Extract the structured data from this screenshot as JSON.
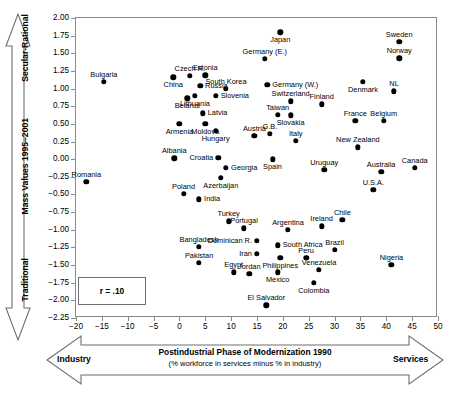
{
  "figure": {
    "annotation_r": "r = .10"
  },
  "axes": {
    "y_meta_top": "Secular-Rational",
    "y_meta_mid": "Mass Values 1995–2001",
    "y_meta_bottom": "Traditional",
    "x_meta_left": "Industry",
    "x_meta_right": "Services",
    "x_title": "Postindustrial Phase of Modernization 1990",
    "x_subtitle": "(% workforce in services minus % in industry)",
    "y_ticks": [
      "2.00",
      "1.75",
      "1.50",
      "1.25",
      "1.00",
      "0.75",
      "0.50",
      "0.25",
      "0.00",
      "−0.25",
      "−0.50",
      "−0.75",
      "−1.00",
      "−1.25",
      "−1.50",
      "−1.75",
      "−2.00",
      "−2.25"
    ],
    "x_ticks": [
      "−20",
      "−15",
      "−10",
      "−5",
      "0",
      "5",
      "10",
      "15",
      "20",
      "25",
      "30",
      "35",
      "40",
      "45",
      "50"
    ]
  },
  "chart_data": {
    "type": "scatter",
    "title": "",
    "xlabel": "Postindustrial Phase of Modernization 1990 (% workforce in services minus % in industry)",
    "ylabel": "Mass Values 1995–2001 (Traditional vs Secular-Rational)",
    "xlim": [
      -20,
      50
    ],
    "ylim": [
      -2.25,
      2.0
    ],
    "xticks": [
      -20,
      -15,
      -10,
      -5,
      0,
      5,
      10,
      15,
      20,
      25,
      30,
      35,
      40,
      45,
      50
    ],
    "yticks": [
      2.0,
      1.75,
      1.5,
      1.25,
      1.0,
      0.75,
      0.5,
      0.25,
      0.0,
      -0.25,
      -0.5,
      -0.75,
      -1.0,
      -1.25,
      -1.5,
      -1.75,
      -2.0,
      -2.25
    ],
    "grid": false,
    "legend": false,
    "annotations": [
      "r = .10"
    ],
    "points": [
      {
        "label": "Japan",
        "x": 19.5,
        "y": 1.8,
        "lpos": "below"
      },
      {
        "label": "Sweden",
        "x": 42.5,
        "y": 1.66,
        "lpos": "above"
      },
      {
        "label": "Norway",
        "x": 42.5,
        "y": 1.43,
        "lpos": "above"
      },
      {
        "label": "Germany (E.)",
        "x": 16.5,
        "y": 1.42,
        "lpos": "above"
      },
      {
        "label": "Estonia",
        "x": 5.0,
        "y": 1.19,
        "lpos": "above"
      },
      {
        "label": "Czech R.",
        "x": 2.0,
        "y": 1.18,
        "lpos": "above"
      },
      {
        "label": "Bulgaria",
        "x": -14.6,
        "y": 1.1,
        "lpos": "above"
      },
      {
        "label": "China",
        "x": -1.2,
        "y": 1.16,
        "lpos": "below"
      },
      {
        "label": "Denmark",
        "x": 35.5,
        "y": 1.1,
        "lpos": "below"
      },
      {
        "label": "Germany (W.)",
        "x": 17.0,
        "y": 1.05,
        "lpos": "right"
      },
      {
        "label": "South Korea",
        "x": 9.0,
        "y": 1.0,
        "lpos": "above"
      },
      {
        "label": "Russia",
        "x": 4.0,
        "y": 1.04,
        "lpos": "right"
      },
      {
        "label": "NL",
        "x": 41.5,
        "y": 0.96,
        "lpos": "above"
      },
      {
        "label": "Lithuania",
        "x": 3.0,
        "y": 0.9,
        "lpos": "below"
      },
      {
        "label": "Slovenia",
        "x": 7.0,
        "y": 0.9,
        "lpos": "right"
      },
      {
        "label": "Belarus",
        "x": 1.5,
        "y": 0.86,
        "lpos": "below"
      },
      {
        "label": "Switzerland",
        "x": 21.5,
        "y": 0.82,
        "lpos": "above"
      },
      {
        "label": "Finland",
        "x": 27.5,
        "y": 0.78,
        "lpos": "above"
      },
      {
        "label": "Latvia",
        "x": 4.5,
        "y": 0.65,
        "lpos": "right"
      },
      {
        "label": "Taiwan",
        "x": 19.0,
        "y": 0.63,
        "lpos": "above"
      },
      {
        "label": "Slovakia",
        "x": 21.5,
        "y": 0.62,
        "lpos": "below"
      },
      {
        "label": "France",
        "x": 34.0,
        "y": 0.54,
        "lpos": "above"
      },
      {
        "label": "Belgium",
        "x": 39.5,
        "y": 0.54,
        "lpos": "above"
      },
      {
        "label": "Moldova",
        "x": 5.0,
        "y": 0.5,
        "lpos": "below"
      },
      {
        "label": "Armenia",
        "x": 0.0,
        "y": 0.5,
        "lpos": "below"
      },
      {
        "label": "Hungary",
        "x": 7.0,
        "y": 0.4,
        "lpos": "below"
      },
      {
        "label": "Austria",
        "x": 14.5,
        "y": 0.33,
        "lpos": "above"
      },
      {
        "label": "G.B.",
        "x": 17.5,
        "y": 0.36,
        "lpos": "above"
      },
      {
        "label": "Italy",
        "x": 22.5,
        "y": 0.26,
        "lpos": "above"
      },
      {
        "label": "New Zealand",
        "x": 34.5,
        "y": 0.17,
        "lpos": "above"
      },
      {
        "label": "Albania",
        "x": -1.0,
        "y": 0.01,
        "lpos": "above"
      },
      {
        "label": "Croatia",
        "x": 7.5,
        "y": 0.02,
        "lpos": "left"
      },
      {
        "label": "Spain",
        "x": 18.0,
        "y": 0.0,
        "lpos": "below"
      },
      {
        "label": "Georgia",
        "x": 9.0,
        "y": -0.12,
        "lpos": "right"
      },
      {
        "label": "Canada",
        "x": 45.5,
        "y": -0.12,
        "lpos": "above"
      },
      {
        "label": "Uruguay",
        "x": 28.0,
        "y": -0.15,
        "lpos": "above"
      },
      {
        "label": "Australia",
        "x": 39.0,
        "y": -0.18,
        "lpos": "above"
      },
      {
        "label": "Azerbaijan",
        "x": 8.0,
        "y": -0.26,
        "lpos": "below"
      },
      {
        "label": "Romania",
        "x": -18.0,
        "y": -0.32,
        "lpos": "above"
      },
      {
        "label": "U.S.A.",
        "x": 37.5,
        "y": -0.43,
        "lpos": "above"
      },
      {
        "label": "Poland",
        "x": 0.8,
        "y": -0.49,
        "lpos": "above"
      },
      {
        "label": "India",
        "x": 3.8,
        "y": -0.57,
        "lpos": "right"
      },
      {
        "label": "Turkey",
        "x": 9.5,
        "y": -0.88,
        "lpos": "above"
      },
      {
        "label": "Chile",
        "x": 31.5,
        "y": -0.86,
        "lpos": "above"
      },
      {
        "label": "Ireland",
        "x": 27.5,
        "y": -0.95,
        "lpos": "above"
      },
      {
        "label": "Portugal",
        "x": 12.5,
        "y": -0.98,
        "lpos": "above"
      },
      {
        "label": "Argentina",
        "x": 21.0,
        "y": -1.0,
        "lpos": "above"
      },
      {
        "label": "Dominican R.",
        "x": 15.0,
        "y": -1.16,
        "lpos": "left"
      },
      {
        "label": "Bangladesh",
        "x": 3.8,
        "y": -1.24,
        "lpos": "above"
      },
      {
        "label": "South Africa",
        "x": 19.0,
        "y": -1.22,
        "lpos": "right"
      },
      {
        "label": "Brazil",
        "x": 30.0,
        "y": -1.28,
        "lpos": "above"
      },
      {
        "label": "Iran",
        "x": 15.0,
        "y": -1.34,
        "lpos": "left"
      },
      {
        "label": "Philippines",
        "x": 19.5,
        "y": -1.4,
        "lpos": "below"
      },
      {
        "label": "Peru",
        "x": 24.5,
        "y": -1.4,
        "lpos": "above"
      },
      {
        "label": "Pakistan",
        "x": 3.8,
        "y": -1.47,
        "lpos": "above"
      },
      {
        "label": "Nigeria",
        "x": 41.0,
        "y": -1.5,
        "lpos": "above"
      },
      {
        "label": "Venezuela",
        "x": 27.0,
        "y": -1.57,
        "lpos": "above"
      },
      {
        "label": "Egypt",
        "x": 10.5,
        "y": -1.6,
        "lpos": "above"
      },
      {
        "label": "Jordan",
        "x": 13.5,
        "y": -1.62,
        "lpos": "above"
      },
      {
        "label": "Mexico",
        "x": 19.0,
        "y": -1.6,
        "lpos": "below"
      },
      {
        "label": "Colombia",
        "x": 26.0,
        "y": -1.75,
        "lpos": "below"
      },
      {
        "label": "El Salvador",
        "x": 16.8,
        "y": -2.07,
        "lpos": "above"
      }
    ]
  }
}
